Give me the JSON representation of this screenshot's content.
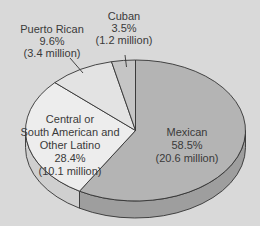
{
  "chart_data": {
    "type": "pie",
    "style": "3d-pie",
    "title": "",
    "start_angle_deg": 0,
    "direction": "clockwise",
    "slices": [
      {
        "name": "Mexican",
        "label_lines": [
          "Mexican",
          "58.5%",
          "(20.6 million)"
        ],
        "percent": 58.5,
        "value_millions": 20.6,
        "color": "#b4b4b4",
        "side_color": "#9e9e9e"
      },
      {
        "name": "Central or South American and Other Latino",
        "label_lines": [
          "Central or",
          "South American and",
          "Other Latino",
          "28.4%",
          "(10.1 million)"
        ],
        "percent": 28.4,
        "value_millions": 10.1,
        "color": "#ededed",
        "side_color": "#cfcfcf"
      },
      {
        "name": "Puerto Rican",
        "label_lines": [
          "Puerto Rican",
          "9.6%",
          "(3.4 million)"
        ],
        "percent": 9.6,
        "value_millions": 3.4,
        "color": "#e3e3e3",
        "side_color": "#c8c8c8"
      },
      {
        "name": "Cuban",
        "label_lines": [
          "Cuban",
          "3.5%",
          "(1.2 million)"
        ],
        "percent": 3.5,
        "value_millions": 1.2,
        "color": "#c5c5c5",
        "side_color": "#ababab"
      }
    ],
    "legend": "none (inline labels)"
  },
  "labels": {
    "mexican": {
      "name": "Mexican",
      "pct": "58.5%",
      "value": "(20.6 million)"
    },
    "central": {
      "line1": "Central or",
      "line2": "South American and",
      "line3": "Other Latino",
      "pct": "28.4%",
      "value": "(10.1 million)"
    },
    "puerto_rican": {
      "name": "Puerto Rican",
      "pct": "9.6%",
      "value": "(3.4 million)"
    },
    "cuban": {
      "name": "Cuban",
      "pct": "3.5%",
      "value": "(1.2 million)"
    }
  }
}
